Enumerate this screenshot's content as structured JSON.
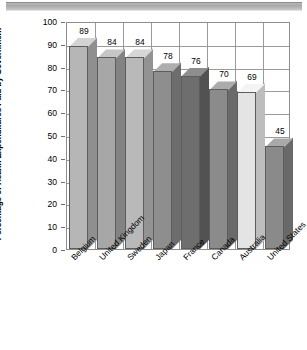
{
  "chart_data": {
    "type": "bar",
    "title": "",
    "subtitle": "",
    "xlabel": "",
    "ylabel": "Percentage of Health Expenditures Paid by Government",
    "ylim": [
      0,
      100
    ],
    "ytick_step": 10,
    "yticks": [
      "100",
      "90",
      "80",
      "70",
      "60",
      "50",
      "40",
      "30",
      "20",
      "10",
      "0"
    ],
    "grid": "horizontal-and-vertical",
    "legend": "none",
    "style": "3d-bars",
    "categories": [
      "Belgium",
      "United Kingdom",
      "Sweden",
      "Japan",
      "France",
      "Canada",
      "Australia",
      "United States"
    ],
    "values": [
      89,
      84,
      84,
      78,
      76,
      70,
      69,
      45
    ],
    "value_labels": [
      "89",
      "84",
      "84",
      "78",
      "76",
      "70",
      "69",
      "45"
    ],
    "bar_colors": [
      "#b6b6b6",
      "#a7a7a7",
      "#b9b9b9",
      "#8e8e8e",
      "#6e6e6e",
      "#8b8b8b",
      "#e4e4e4",
      "#8a8a8a"
    ],
    "bar_top_colors": [
      "#d3d3d3",
      "#c6c6c6",
      "#d6d6d6",
      "#aeaeae",
      "#8e8e8e",
      "#ababab",
      "#f4f4f4",
      "#a9a9a9"
    ],
    "bar_side_colors": [
      "#8f8f8f",
      "#838383",
      "#939393",
      "#6d6d6d",
      "#525252",
      "#6a6a6a",
      "#bdbdbd",
      "#696969"
    ]
  },
  "figure": {
    "background_color": "#ffffff",
    "frame_color": "#8d8d8d",
    "grid_color": "#9a9a9a",
    "text_color": "#000000"
  }
}
